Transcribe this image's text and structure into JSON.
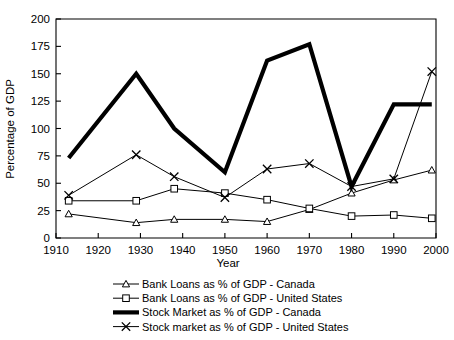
{
  "chart_data": {
    "type": "line",
    "title": "",
    "xlabel": "Year",
    "ylabel": "Percentage of GDP",
    "xlim": [
      1910,
      2000
    ],
    "ylim": [
      0,
      200
    ],
    "xticks": [
      1910,
      1920,
      1930,
      1940,
      1950,
      1960,
      1970,
      1980,
      1990,
      2000
    ],
    "yticks": [
      0,
      25,
      50,
      75,
      100,
      125,
      150,
      175,
      200
    ],
    "grid": false,
    "legend_position": "bottom",
    "series": [
      {
        "name": "Bank Loans as % of GDP - Canada",
        "marker": "triangle",
        "line_weight": "thin",
        "x": [
          1913,
          1929,
          1938,
          1950,
          1960,
          1970,
          1980,
          1990,
          1999
        ],
        "values": [
          22,
          14,
          17,
          17,
          15,
          26,
          41,
          53,
          62
        ]
      },
      {
        "name": "Bank Loans as % of GDP - United States",
        "marker": "square",
        "line_weight": "thin",
        "x": [
          1913,
          1929,
          1938,
          1950,
          1960,
          1970,
          1980,
          1990,
          1999
        ],
        "values": [
          34,
          34,
          45,
          41,
          35,
          27,
          20,
          21,
          18
        ]
      },
      {
        "name": "Stock Market as % of GDP - Canada",
        "marker": "none",
        "line_weight": "thick",
        "x": [
          1913,
          1929,
          1938,
          1950,
          1960,
          1970,
          1980,
          1990,
          1999
        ],
        "values": [
          73,
          150,
          100,
          60,
          162,
          177,
          47,
          122,
          122
        ]
      },
      {
        "name": "Stock market as % of GDP - United States",
        "marker": "x",
        "line_weight": "thin",
        "x": [
          1913,
          1929,
          1938,
          1950,
          1960,
          1970,
          1980,
          1990,
          1999
        ],
        "values": [
          39,
          76,
          56,
          37,
          63,
          68,
          47,
          54,
          152
        ]
      }
    ]
  },
  "axes": {
    "y_title": "Percentage of GDP",
    "x_title": "Year",
    "y_tick_labels": [
      "200",
      "175",
      "150",
      "125",
      "100",
      "75",
      "50",
      "25",
      "0"
    ],
    "x_tick_labels": [
      "1910",
      "1920",
      "1930",
      "1940",
      "1950",
      "1960",
      "1970",
      "1980",
      "1990",
      "2000"
    ]
  },
  "legend": {
    "entries": [
      {
        "label": "Bank Loans as % of GDP - Canada",
        "marker": "triangle"
      },
      {
        "label": "Bank Loans as % of GDP - United States",
        "marker": "square"
      },
      {
        "label": "Stock Market as % of GDP - Canada",
        "marker": "thickline"
      },
      {
        "label": "Stock market as % of GDP - United States",
        "marker": "x"
      }
    ]
  },
  "colors": {
    "line": "#000000",
    "background": "#ffffff",
    "marker_fill": "#ffffff"
  }
}
